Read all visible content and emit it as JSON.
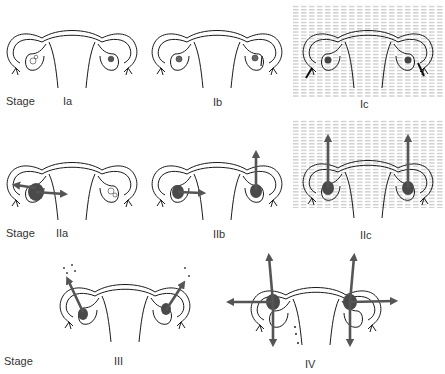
{
  "figure": {
    "row_label": "Stage",
    "colors": {
      "outline": "#1a1a1a",
      "tumor": "#4a4a4a",
      "arrow": "#555555",
      "shading_line": "#9a9a9a"
    },
    "rows": [
      {
        "stage_label": "Stage",
        "panels": [
          {
            "id": "Ia",
            "label": "Ia",
            "shaded": false
          },
          {
            "id": "Ib",
            "label": "Ib",
            "shaded": false
          },
          {
            "id": "Ic",
            "label": "Ic",
            "shaded": true
          }
        ]
      },
      {
        "stage_label": "Stage",
        "panels": [
          {
            "id": "IIa",
            "label": "IIa",
            "shaded": false
          },
          {
            "id": "IIb",
            "label": "IIb",
            "shaded": false
          },
          {
            "id": "IIc",
            "label": "IIc",
            "shaded": true
          }
        ]
      },
      {
        "stage_label": "Stage",
        "panels": [
          {
            "id": "III",
            "label": "III",
            "shaded": false
          },
          {
            "id": "IV",
            "label": "IV",
            "shaded": false
          }
        ]
      }
    ]
  }
}
